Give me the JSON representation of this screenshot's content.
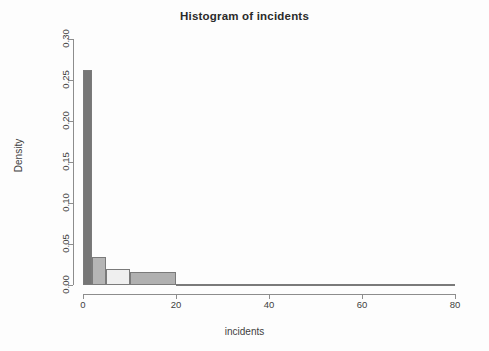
{
  "chart_data": {
    "type": "bar",
    "title": "Histogram of incidents",
    "xlabel": "incidents",
    "ylabel": "Density",
    "xlim": [
      0,
      80
    ],
    "ylim": [
      0.0,
      0.3
    ],
    "grid": false,
    "legend": null,
    "xticks": [
      "0",
      "20",
      "40",
      "60",
      "80"
    ],
    "xtick_values": [
      0,
      20,
      40,
      60,
      80
    ],
    "yticks": [
      "0.00",
      "0.05",
      "0.10",
      "0.15",
      "0.20",
      "0.25",
      "0.30"
    ],
    "ytick_values": [
      0.0,
      0.05,
      0.1,
      0.15,
      0.2,
      0.25,
      0.3
    ],
    "bins": [
      {
        "label": "0-2",
        "x0": 0,
        "x1": 2,
        "value": 0.262,
        "color": "#767676"
      },
      {
        "label": "2-5",
        "x0": 2,
        "x1": 5,
        "value": 0.034,
        "color": "#b5b5b5"
      },
      {
        "label": "5-10",
        "x0": 5,
        "x1": 10,
        "value": 0.02,
        "color": "#efefef"
      },
      {
        "label": "10-20",
        "x0": 10,
        "x1": 20,
        "value": 0.016,
        "color": "#b0b0b0"
      },
      {
        "label": "20-80",
        "x0": 20,
        "x1": 80,
        "value": 0.001,
        "color": "#6f6f6f"
      }
    ],
    "categories": [
      "0-2",
      "2-5",
      "5-10",
      "10-20",
      "20-80"
    ],
    "values": [
      0.262,
      0.034,
      0.02,
      0.016,
      0.001
    ]
  },
  "colors": {
    "axis": "#8d8d8d",
    "text": "#3f3f3f",
    "title": "#2b2b2b",
    "background": "#fdfdfd"
  }
}
